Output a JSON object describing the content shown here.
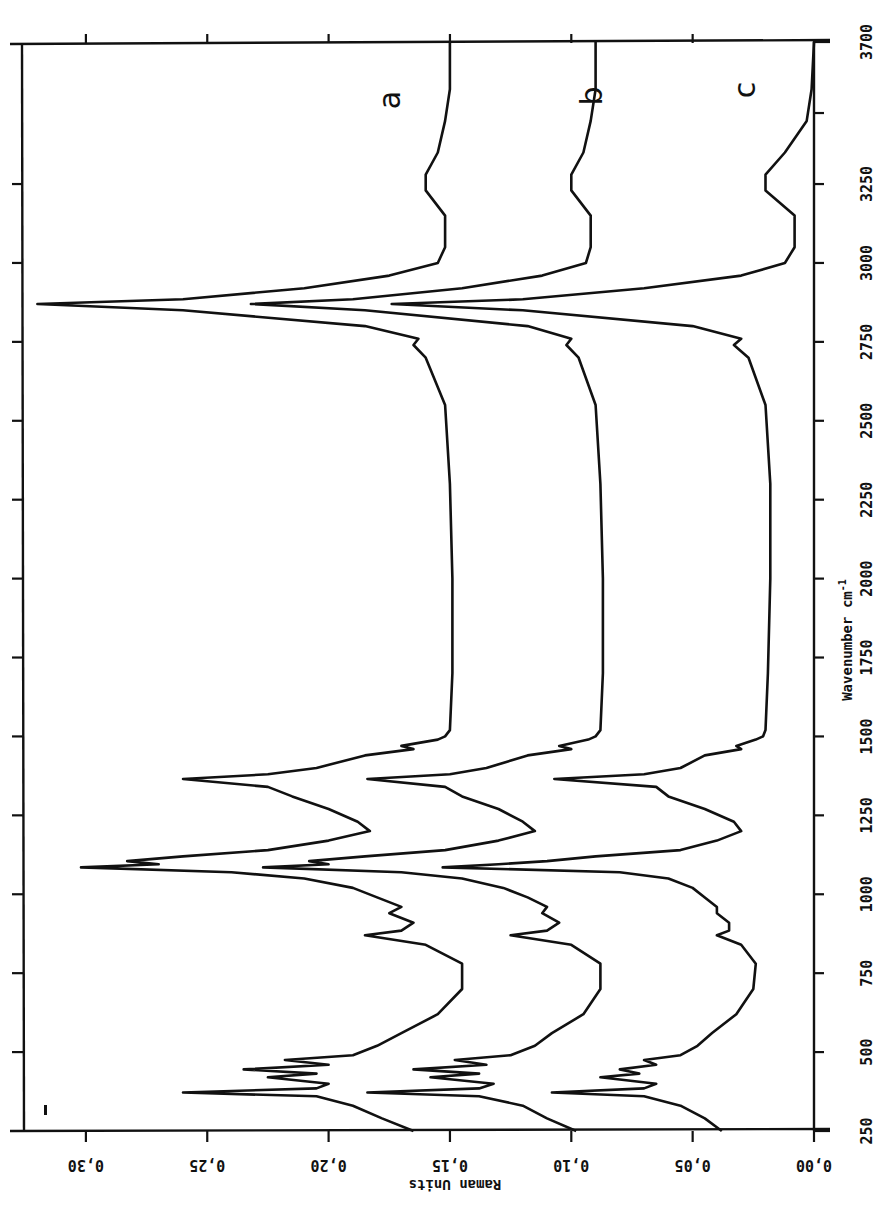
{
  "chart_data": {
    "type": "line",
    "orientation": "rotated 90 degrees clockwise (wavenumber axis vertical on right, increasing upward; intensity axis horizontal at bottom, increasing leftward)",
    "title": "",
    "xlabel": "Wavenumber cm-1",
    "ylabel": "Raman Units",
    "xlim": [
      250,
      3700
    ],
    "ylim": [
      0.0,
      0.32
    ],
    "x_ticks": [
      250,
      500,
      750,
      1000,
      1250,
      1500,
      1750,
      2000,
      2250,
      2500,
      2750,
      3000,
      3250,
      3700
    ],
    "y_ticks": [
      "0.00",
      "0.05",
      "0.10",
      "0.15",
      "0.20",
      "0.25",
      "0.30"
    ],
    "grid": false,
    "legend": "inline labels a, b, c near 3550 cm-1",
    "series": [
      {
        "name": "a",
        "x": [
          250,
          290,
          330,
          360,
          372,
          385,
          400,
          420,
          432,
          445,
          460,
          475,
          490,
          520,
          560,
          620,
          700,
          780,
          840,
          870,
          885,
          910,
          940,
          960,
          990,
          1020,
          1050,
          1070,
          1085,
          1095,
          1105,
          1120,
          1140,
          1170,
          1200,
          1230,
          1270,
          1310,
          1340,
          1365,
          1380,
          1400,
          1440,
          1460,
          1470,
          1490,
          1500,
          1520,
          1700,
          2000,
          2300,
          2550,
          2700,
          2740,
          2760,
          2800,
          2850,
          2870,
          2885,
          2920,
          2960,
          3000,
          3050,
          3150,
          3230,
          3280,
          3350,
          3450,
          3550,
          3700
        ],
        "y": [
          0.165,
          0.178,
          0.19,
          0.205,
          0.26,
          0.205,
          0.2,
          0.225,
          0.205,
          0.235,
          0.2,
          0.218,
          0.19,
          0.18,
          0.17,
          0.155,
          0.145,
          0.145,
          0.16,
          0.185,
          0.17,
          0.165,
          0.175,
          0.17,
          0.18,
          0.19,
          0.21,
          0.24,
          0.302,
          0.27,
          0.283,
          0.26,
          0.225,
          0.2,
          0.183,
          0.188,
          0.2,
          0.215,
          0.225,
          0.26,
          0.225,
          0.205,
          0.185,
          0.165,
          0.17,
          0.155,
          0.152,
          0.15,
          0.149,
          0.149,
          0.15,
          0.152,
          0.16,
          0.165,
          0.163,
          0.185,
          0.26,
          0.32,
          0.26,
          0.21,
          0.175,
          0.155,
          0.152,
          0.152,
          0.16,
          0.16,
          0.155,
          0.152,
          0.15,
          0.15
        ]
      },
      {
        "name": "b",
        "x": [
          250,
          290,
          330,
          360,
          372,
          385,
          400,
          420,
          432,
          445,
          460,
          475,
          490,
          520,
          560,
          620,
          700,
          780,
          840,
          870,
          885,
          910,
          940,
          960,
          990,
          1020,
          1050,
          1070,
          1085,
          1095,
          1105,
          1120,
          1140,
          1170,
          1200,
          1230,
          1270,
          1310,
          1340,
          1365,
          1380,
          1400,
          1440,
          1460,
          1470,
          1490,
          1500,
          1520,
          1700,
          2000,
          2300,
          2550,
          2700,
          2740,
          2760,
          2800,
          2850,
          2870,
          2885,
          2920,
          2960,
          3000,
          3050,
          3150,
          3230,
          3280,
          3350,
          3450,
          3550,
          3700
        ],
        "y": [
          0.098,
          0.11,
          0.12,
          0.138,
          0.184,
          0.138,
          0.132,
          0.158,
          0.138,
          0.165,
          0.135,
          0.148,
          0.125,
          0.115,
          0.108,
          0.095,
          0.088,
          0.088,
          0.1,
          0.125,
          0.11,
          0.105,
          0.112,
          0.11,
          0.118,
          0.128,
          0.145,
          0.17,
          0.227,
          0.2,
          0.208,
          0.185,
          0.152,
          0.13,
          0.115,
          0.12,
          0.13,
          0.145,
          0.152,
          0.184,
          0.15,
          0.135,
          0.118,
          0.1,
          0.105,
          0.093,
          0.09,
          0.088,
          0.087,
          0.087,
          0.088,
          0.09,
          0.097,
          0.102,
          0.1,
          0.118,
          0.185,
          0.232,
          0.19,
          0.145,
          0.112,
          0.094,
          0.092,
          0.092,
          0.1,
          0.1,
          0.095,
          0.092,
          0.09,
          0.09
        ]
      },
      {
        "name": "c",
        "x": [
          250,
          290,
          330,
          360,
          372,
          385,
          400,
          420,
          432,
          445,
          460,
          475,
          490,
          520,
          560,
          620,
          700,
          780,
          840,
          870,
          885,
          910,
          940,
          960,
          990,
          1020,
          1050,
          1070,
          1085,
          1095,
          1105,
          1120,
          1140,
          1170,
          1200,
          1230,
          1270,
          1310,
          1340,
          1365,
          1380,
          1400,
          1440,
          1460,
          1470,
          1490,
          1500,
          1520,
          1700,
          2000,
          2300,
          2550,
          2700,
          2740,
          2760,
          2800,
          2850,
          2870,
          2885,
          2920,
          2960,
          3000,
          3050,
          3150,
          3230,
          3280,
          3350,
          3450,
          3550,
          3700
        ],
        "y": [
          0.038,
          0.045,
          0.055,
          0.07,
          0.108,
          0.07,
          0.065,
          0.088,
          0.072,
          0.08,
          0.065,
          0.07,
          0.055,
          0.048,
          0.042,
          0.032,
          0.025,
          0.024,
          0.03,
          0.04,
          0.035,
          0.035,
          0.04,
          0.04,
          0.045,
          0.05,
          0.06,
          0.08,
          0.153,
          0.13,
          0.11,
          0.09,
          0.055,
          0.04,
          0.03,
          0.033,
          0.045,
          0.06,
          0.065,
          0.107,
          0.07,
          0.055,
          0.045,
          0.03,
          0.032,
          0.024,
          0.021,
          0.02,
          0.019,
          0.018,
          0.018,
          0.02,
          0.027,
          0.033,
          0.03,
          0.05,
          0.12,
          0.174,
          0.12,
          0.07,
          0.03,
          0.012,
          0.008,
          0.008,
          0.02,
          0.02,
          0.012,
          0.003,
          0.001,
          0.0
        ]
      }
    ]
  },
  "labels": {
    "xlabel_main": "Wavenumber cm",
    "xlabel_sup": "-1",
    "ylabel": "Raman Units",
    "series_a": "a",
    "series_b": "b",
    "series_c": "c",
    "stray_mark": "r"
  }
}
